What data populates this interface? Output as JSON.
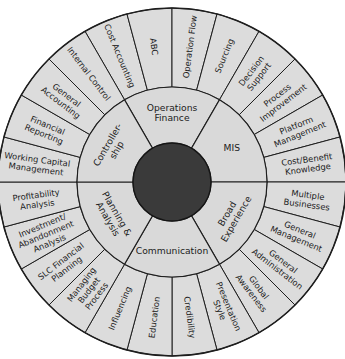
{
  "diagram": {
    "type": "competency-wheel",
    "center_hub": {
      "color": "#3a3a3a",
      "label": ""
    },
    "colors": {
      "segment_fill": "#dcdcdc",
      "line": "#1e1e1e",
      "hub": "#3a3a3a",
      "background": "#ffffff"
    },
    "categories": [
      {
        "name": "Operations Finance",
        "lines": [
          "Operations",
          "Finance"
        ],
        "skills": [
          {
            "name": "Cost Accounting",
            "lines": [
              "Cost Accounting"
            ]
          },
          {
            "name": "ABC",
            "lines": [
              "ABC"
            ]
          },
          {
            "name": "Operation Flow",
            "lines": [
              "Operation Flow"
            ]
          },
          {
            "name": "Sourcing",
            "lines": [
              "Sourcing"
            ]
          }
        ]
      },
      {
        "name": "MIS",
        "lines": [
          "MIS"
        ],
        "skills": [
          {
            "name": "Decision Support",
            "lines": [
              "Decision",
              "Support"
            ]
          },
          {
            "name": "Process Improvement",
            "lines": [
              "Process",
              "Improvement"
            ]
          },
          {
            "name": "Platform Management",
            "lines": [
              "Platform",
              "Management"
            ]
          },
          {
            "name": "Cost/Benefit Knowledge",
            "lines": [
              "Cost/Benefit",
              "Knowledge"
            ]
          }
        ]
      },
      {
        "name": "Broad Experience",
        "lines": [
          "Broad",
          "Experience"
        ],
        "skills": [
          {
            "name": "Multiple Businesses",
            "lines": [
              "Multiple",
              "Businesses"
            ]
          },
          {
            "name": "General Management",
            "lines": [
              "General",
              "Management"
            ]
          },
          {
            "name": "General Administration",
            "lines": [
              "General",
              "Administration"
            ]
          },
          {
            "name": "Global Awareness",
            "lines": [
              "Global",
              "Awareness"
            ]
          }
        ]
      },
      {
        "name": "Communication",
        "lines": [
          "Communication"
        ],
        "skills": [
          {
            "name": "Presentation Style",
            "lines": [
              "Presentation",
              "Style"
            ]
          },
          {
            "name": "Credibility",
            "lines": [
              "Credibility"
            ]
          },
          {
            "name": "Education",
            "lines": [
              "Education"
            ]
          },
          {
            "name": "Influencing",
            "lines": [
              "Influencing"
            ]
          }
        ]
      },
      {
        "name": "Planning & Analysis",
        "lines": [
          "Planning &",
          "Analysis"
        ],
        "skills": [
          {
            "name": "Managing Budget Process",
            "lines": [
              "Managing",
              "Budget",
              "Process"
            ]
          },
          {
            "name": "SLC Financial Planning",
            "lines": [
              "SLC Financial",
              "Planning"
            ]
          },
          {
            "name": "Investment/Abandonment Analysis",
            "lines": [
              "Investment/",
              "Abandonment",
              "Analysis"
            ]
          },
          {
            "name": "Profitability Analysis",
            "lines": [
              "Profitability",
              "Analysis"
            ]
          }
        ]
      },
      {
        "name": "Controllership",
        "lines": [
          "Controller-",
          "ship"
        ],
        "skills": [
          {
            "name": "Working Capital Management",
            "lines": [
              "Working Capital",
              "Management"
            ]
          },
          {
            "name": "Financial Reporting",
            "lines": [
              "Financial",
              "Reporting"
            ]
          },
          {
            "name": "General Accounting",
            "lines": [
              "General",
              "Accounting"
            ]
          },
          {
            "name": "Internal Control",
            "lines": [
              "Internal Control"
            ]
          }
        ]
      }
    ]
  }
}
